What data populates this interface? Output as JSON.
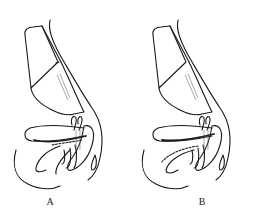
{
  "figure": {
    "panels": [
      {
        "id": "A",
        "label": "A",
        "variant": "solid-lower-curve"
      },
      {
        "id": "B",
        "label": "B",
        "variant": "dashed-lower-curve"
      }
    ],
    "colors": {
      "stroke": "#1a1a1a",
      "background": "#ffffff"
    }
  }
}
